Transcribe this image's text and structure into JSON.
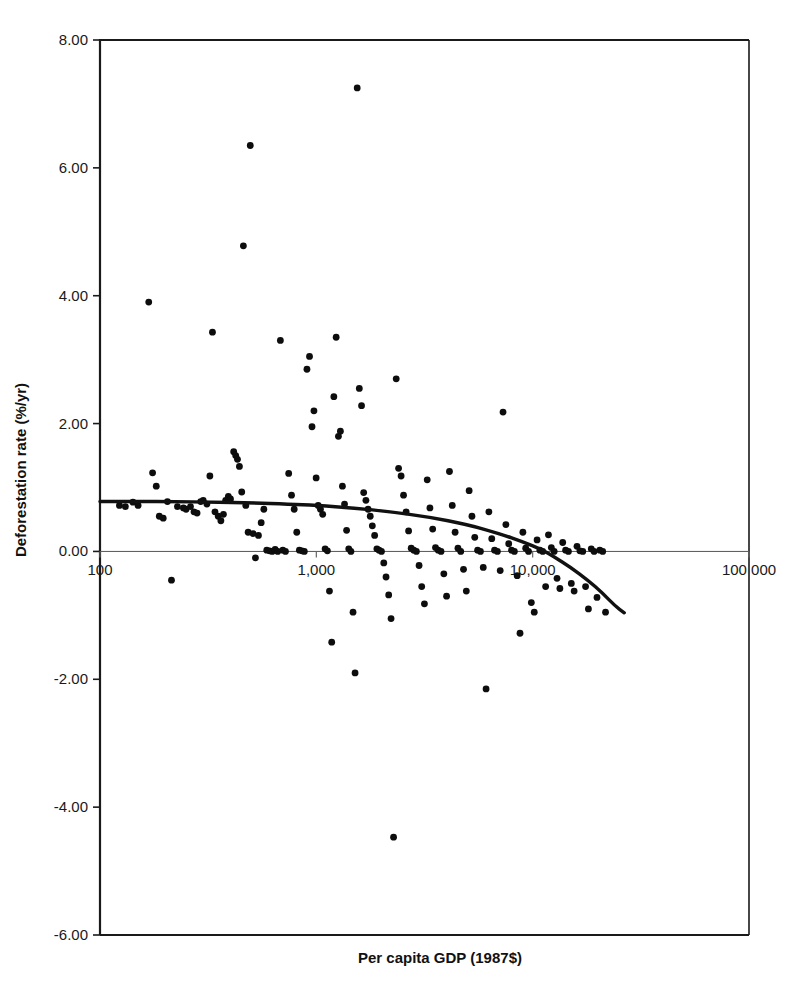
{
  "chart_data": {
    "type": "scatter",
    "title": "",
    "xlabel": "Per capita GDP (1987$)",
    "ylabel": "Deforestation rate (%/yr)",
    "x_scale": "log",
    "xlim": [
      100,
      100000
    ],
    "ylim": [
      -6.0,
      8.0
    ],
    "grid": false,
    "legend": null,
    "x_ticks": [
      {
        "value": 100,
        "label": "100"
      },
      {
        "value": 1000,
        "label": "1,000"
      },
      {
        "value": 10000,
        "label": "10,000"
      },
      {
        "value": 100000,
        "label": "100 000"
      }
    ],
    "y_ticks": [
      {
        "value": 8.0,
        "label": "8.00"
      },
      {
        "value": 6.0,
        "label": "6.00"
      },
      {
        "value": 4.0,
        "label": "4.00"
      },
      {
        "value": 2.0,
        "label": "2.00"
      },
      {
        "value": 0.0,
        "label": "0.00"
      },
      {
        "value": -2.0,
        "label": "-2.00"
      },
      {
        "value": -4.0,
        "label": "-4.00"
      },
      {
        "value": -6.0,
        "label": "-6.00"
      }
    ],
    "series": [
      {
        "name": "Countries",
        "marker": "circle",
        "color": "#0d0d0d",
        "points": [
          [
            123,
            0.72
          ],
          [
            131,
            0.7
          ],
          [
            142,
            0.77
          ],
          [
            150,
            0.72
          ],
          [
            168,
            3.9
          ],
          [
            175,
            1.23
          ],
          [
            182,
            1.02
          ],
          [
            188,
            0.55
          ],
          [
            196,
            0.52
          ],
          [
            205,
            0.78
          ],
          [
            214,
            -0.45
          ],
          [
            228,
            0.7
          ],
          [
            243,
            0.68
          ],
          [
            250,
            0.66
          ],
          [
            262,
            0.7
          ],
          [
            272,
            0.62
          ],
          [
            281,
            0.6
          ],
          [
            292,
            0.78
          ],
          [
            300,
            0.8
          ],
          [
            312,
            0.74
          ],
          [
            322,
            1.18
          ],
          [
            331,
            3.43
          ],
          [
            340,
            0.62
          ],
          [
            352,
            0.55
          ],
          [
            362,
            0.48
          ],
          [
            372,
            0.58
          ],
          [
            381,
            0.8
          ],
          [
            392,
            0.86
          ],
          [
            401,
            0.82
          ],
          [
            415,
            1.56
          ],
          [
            424,
            1.5
          ],
          [
            432,
            1.44
          ],
          [
            441,
            1.33
          ],
          [
            452,
            0.93
          ],
          [
            460,
            4.78
          ],
          [
            472,
            0.72
          ],
          [
            484,
            0.3
          ],
          [
            495,
            6.35
          ],
          [
            510,
            0.28
          ],
          [
            523,
            -0.1
          ],
          [
            540,
            0.25
          ],
          [
            556,
            0.45
          ],
          [
            572,
            0.66
          ],
          [
            590,
            0.02
          ],
          [
            608,
            0.01
          ],
          [
            625,
            0.0
          ],
          [
            645,
            0.03
          ],
          [
            663,
            0.0
          ],
          [
            682,
            3.3
          ],
          [
            700,
            0.02
          ],
          [
            720,
            0.0
          ],
          [
            745,
            1.22
          ],
          [
            768,
            0.88
          ],
          [
            790,
            0.66
          ],
          [
            812,
            0.3
          ],
          [
            835,
            0.02
          ],
          [
            858,
            0.01
          ],
          [
            880,
            0.0
          ],
          [
            905,
            2.85
          ],
          [
            930,
            3.05
          ],
          [
            955,
            1.95
          ],
          [
            975,
            2.2
          ],
          [
            998,
            1.15
          ],
          [
            1020,
            0.72
          ],
          [
            1045,
            0.66
          ],
          [
            1070,
            0.58
          ],
          [
            1098,
            0.04
          ],
          [
            1125,
            0.01
          ],
          [
            1150,
            -0.62
          ],
          [
            1178,
            -1.42
          ],
          [
            1205,
            2.42
          ],
          [
            1235,
            3.35
          ],
          [
            1265,
            1.8
          ],
          [
            1292,
            1.88
          ],
          [
            1320,
            1.02
          ],
          [
            1350,
            0.74
          ],
          [
            1380,
            0.33
          ],
          [
            1412,
            0.04
          ],
          [
            1445,
            0.0
          ],
          [
            1478,
            -0.95
          ],
          [
            1510,
            -1.9
          ],
          [
            1545,
            7.25
          ],
          [
            1580,
            2.55
          ],
          [
            1618,
            2.28
          ],
          [
            1655,
            0.92
          ],
          [
            1695,
            0.8
          ],
          [
            1735,
            0.66
          ],
          [
            1775,
            0.55
          ],
          [
            1815,
            0.4
          ],
          [
            1860,
            0.25
          ],
          [
            1905,
            0.04
          ],
          [
            1950,
            0.02
          ],
          [
            2000,
            0.0
          ],
          [
            2050,
            -0.18
          ],
          [
            2100,
            -0.4
          ],
          [
            2160,
            -0.68
          ],
          [
            2215,
            -1.05
          ],
          [
            2275,
            -4.47
          ],
          [
            2340,
            2.7
          ],
          [
            2400,
            1.3
          ],
          [
            2465,
            1.18
          ],
          [
            2530,
            0.88
          ],
          [
            2600,
            0.62
          ],
          [
            2670,
            0.32
          ],
          [
            2745,
            0.05
          ],
          [
            2820,
            0.02
          ],
          [
            2900,
            0.0
          ],
          [
            2985,
            -0.22
          ],
          [
            3070,
            -0.55
          ],
          [
            3160,
            -0.82
          ],
          [
            3255,
            1.12
          ],
          [
            3350,
            0.68
          ],
          [
            3450,
            0.35
          ],
          [
            3555,
            0.06
          ],
          [
            3660,
            0.02
          ],
          [
            3770,
            0.0
          ],
          [
            3885,
            -0.35
          ],
          [
            4000,
            -0.7
          ],
          [
            4125,
            1.25
          ],
          [
            4250,
            0.72
          ],
          [
            4380,
            0.3
          ],
          [
            4515,
            0.05
          ],
          [
            4650,
            0.0
          ],
          [
            4790,
            -0.28
          ],
          [
            4935,
            -0.62
          ],
          [
            5085,
            0.95
          ],
          [
            5240,
            0.55
          ],
          [
            5400,
            0.22
          ],
          [
            5565,
            0.02
          ],
          [
            5735,
            0.0
          ],
          [
            5910,
            -0.25
          ],
          [
            6090,
            -2.15
          ],
          [
            6275,
            0.62
          ],
          [
            6470,
            0.2
          ],
          [
            6665,
            0.02
          ],
          [
            6870,
            0.0
          ],
          [
            7080,
            -0.3
          ],
          [
            7295,
            2.18
          ],
          [
            7520,
            0.42
          ],
          [
            7750,
            0.12
          ],
          [
            7985,
            0.02
          ],
          [
            8230,
            0.0
          ],
          [
            8480,
            -0.38
          ],
          [
            8740,
            -1.28
          ],
          [
            9010,
            0.3
          ],
          [
            9285,
            0.05
          ],
          [
            9570,
            0.0
          ],
          [
            9860,
            -0.8
          ],
          [
            10170,
            -0.95
          ],
          [
            10480,
            0.18
          ],
          [
            10800,
            0.02
          ],
          [
            11130,
            0.0
          ],
          [
            11480,
            -0.55
          ],
          [
            11830,
            0.26
          ],
          [
            12200,
            0.06
          ],
          [
            12570,
            0.0
          ],
          [
            12960,
            -0.42
          ],
          [
            13360,
            -0.58
          ],
          [
            13770,
            0.14
          ],
          [
            14200,
            0.02
          ],
          [
            14630,
            0.0
          ],
          [
            15090,
            -0.5
          ],
          [
            15550,
            -0.62
          ],
          [
            16030,
            0.08
          ],
          [
            16530,
            0.01
          ],
          [
            17040,
            0.0
          ],
          [
            17560,
            -0.55
          ],
          [
            18100,
            -0.9
          ],
          [
            18660,
            0.04
          ],
          [
            19230,
            0.0
          ],
          [
            19830,
            -0.72
          ],
          [
            20440,
            0.02
          ],
          [
            21070,
            0.0
          ],
          [
            21720,
            -0.95
          ]
        ]
      }
    ],
    "fit_curve": {
      "name": "Fitted trend",
      "color": "#111111",
      "points": [
        [
          100,
          0.78
        ],
        [
          150,
          0.78
        ],
        [
          220,
          0.78
        ],
        [
          330,
          0.77
        ],
        [
          500,
          0.76
        ],
        [
          750,
          0.74
        ],
        [
          1000,
          0.72
        ],
        [
          1500,
          0.68
        ],
        [
          2200,
          0.62
        ],
        [
          3300,
          0.54
        ],
        [
          5000,
          0.42
        ],
        [
          7000,
          0.28
        ],
        [
          9000,
          0.15
        ],
        [
          11000,
          0.03
        ],
        [
          12500,
          -0.08
        ],
        [
          15000,
          -0.25
        ],
        [
          18000,
          -0.45
        ],
        [
          21000,
          -0.65
        ],
        [
          24000,
          -0.85
        ],
        [
          26500,
          -0.96
        ]
      ]
    }
  }
}
